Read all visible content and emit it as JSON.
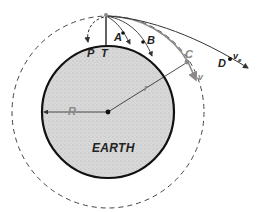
{
  "diagram": {
    "earth_label": "EARTH",
    "labels": {
      "P": "P",
      "T": "T",
      "A": "A",
      "B": "B",
      "C": "C",
      "D": "D",
      "R": "R",
      "r": "r",
      "v": "v",
      "ve": "v",
      "ve_sub": "e"
    },
    "colors": {
      "earth_fill": "#d6d6d6",
      "earth_outline": "#111111",
      "orbit_dashed": "#444444",
      "trajectory_gray": "#8a8a8a",
      "trajectory_dark": "#333333"
    }
  }
}
